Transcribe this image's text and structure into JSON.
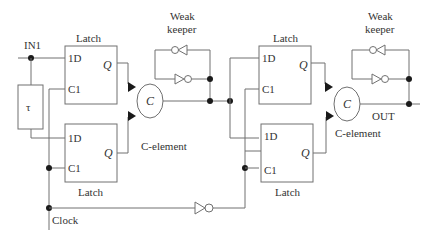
{
  "diagram": {
    "type": "circuit-schematic",
    "inputs": {
      "in1": "IN1",
      "clock": "Clock"
    },
    "output": "OUT",
    "delay": {
      "symbol": "τ"
    },
    "stage1": {
      "latch_top": {
        "title": "Latch",
        "d": "1D",
        "c": "C1",
        "q": "Q"
      },
      "latch_bottom": {
        "title": "Latch",
        "d": "1D",
        "c": "C1",
        "q": "Q"
      },
      "c_element": {
        "symbol": "C",
        "label": "C-element"
      },
      "keeper": {
        "line1": "Weak",
        "line2": "keeper"
      }
    },
    "stage2": {
      "latch_top": {
        "title": "Latch",
        "d": "1D",
        "c": "C1",
        "q": "Q"
      },
      "latch_bottom": {
        "title": "Latch",
        "d": "1D",
        "c": "C1",
        "q": "Q"
      },
      "c_element": {
        "symbol": "C",
        "label": "C-element"
      },
      "keeper": {
        "line1": "Weak",
        "line2": "keeper"
      }
    }
  }
}
